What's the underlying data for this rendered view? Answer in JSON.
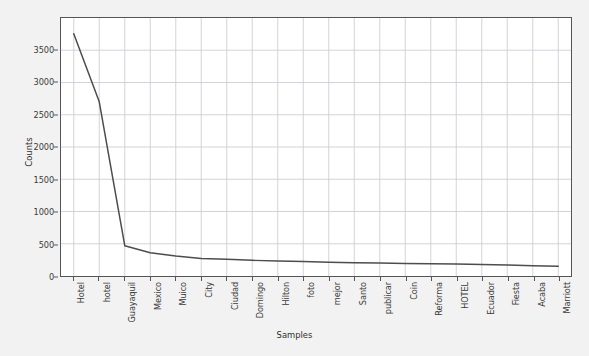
{
  "chart_data": {
    "type": "line",
    "title": "",
    "xlabel": "Samples",
    "ylabel": "Counts",
    "categories": [
      "Hotel",
      "hotel",
      "Guayaquil",
      "Mexico",
      "Muico",
      "City",
      "Ciudad",
      "Domingo",
      "Hilton",
      "foto",
      "mejor",
      "Santo",
      "publicar",
      "Coin",
      "Reforma",
      "HOTEL",
      "Ecuador",
      "Fiesta",
      "Acaba",
      "Marriott"
    ],
    "values": [
      3755,
      2700,
      470,
      360,
      310,
      272,
      258,
      243,
      232,
      223,
      215,
      207,
      200,
      195,
      190,
      185,
      178,
      170,
      160,
      152
    ],
    "ylim": [
      0,
      4000
    ],
    "yticks": [
      0,
      500,
      1000,
      1500,
      2000,
      2500,
      3000,
      3500
    ],
    "ytick_labels": [
      "0",
      "500",
      "1000",
      "1500",
      "2000",
      "2500",
      "3000",
      "3500"
    ],
    "grid": true,
    "legend": false,
    "line_color": "#4d4d4d",
    "grid_color": "#c8c8d2",
    "plot_bgcolor": "#ffffff",
    "figure_bgcolor": "#f2f2f2"
  }
}
